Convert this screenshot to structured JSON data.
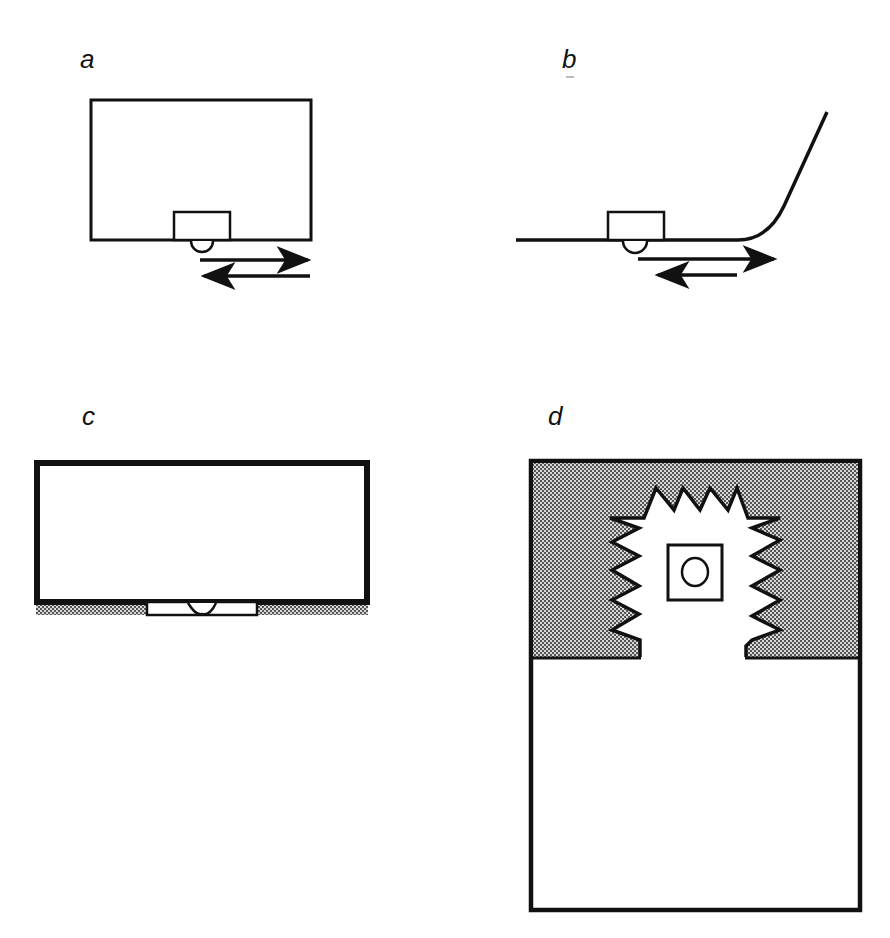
{
  "figure": {
    "colors": {
      "ink": "#111111",
      "background": "#ffffff",
      "stipple_dot": "#444444",
      "stipple_bg": "#d8d8d8"
    },
    "panels": [
      {
        "id": "a",
        "label": "a",
        "description": "Rectangular box resting on surface, small block at bottom edge with half-round bump underneath; two opposing horizontal arrows below (right arrow on top, left arrow below)"
      },
      {
        "id": "b",
        "label": "b",
        "description": "Flat line curving upward at right end; small block on line with half-round bump underneath; right arrow (longer) above left arrow (shorter)"
      },
      {
        "id": "c",
        "label": "c",
        "description": "Wide rectangular box with thick border resting on stippled surface; recessed slot at bottom center with half-round bump"
      },
      {
        "id": "d",
        "label": "d",
        "description": "Tall rectangle; upper part stippled with a zigzag-edged cavity containing a small square with a circle; lower part empty"
      }
    ]
  }
}
